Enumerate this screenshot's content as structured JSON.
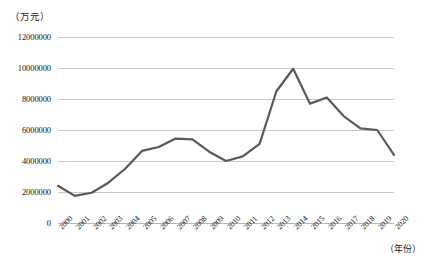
{
  "chart_data": {
    "type": "line",
    "title": "",
    "subtitle": "",
    "xlabel": "（年份）",
    "ylabel": "（万元）",
    "categories": [
      "2000",
      "2001",
      "2002",
      "2003",
      "2004",
      "2005",
      "2006",
      "2007",
      "2008",
      "2009",
      "2010",
      "2011",
      "2012",
      "2013",
      "2014",
      "2015",
      "2016",
      "2017",
      "2018",
      "2019",
      "2020"
    ],
    "values": [
      2400000,
      1750000,
      1950000,
      2600000,
      3500000,
      4650000,
      4900000,
      5450000,
      5400000,
      4600000,
      4000000,
      4300000,
      5100000,
      8500000,
      9950000,
      7700000,
      8100000,
      6900000,
      6100000,
      6000000,
      4400000
    ],
    "series": [
      {
        "name": "",
        "values": [
          2400000,
          1750000,
          1950000,
          2600000,
          3500000,
          4650000,
          4900000,
          5450000,
          5400000,
          4600000,
          4000000,
          4300000,
          5100000,
          8500000,
          9950000,
          7700000,
          8100000,
          6900000,
          6100000,
          6000000,
          4400000
        ]
      }
    ],
    "ylim": [
      0,
      12000000
    ],
    "yticks": [
      0,
      2000000,
      4000000,
      6000000,
      8000000,
      10000000,
      12000000
    ],
    "ytick_labels": [
      "0",
      "2000000",
      "4000000",
      "6000000",
      "8000000",
      "10000000",
      "12000000"
    ],
    "grid": true,
    "grid_axis": "y",
    "legend": false,
    "legend_position": "none",
    "line_color": "#595959",
    "line_width": 2.2,
    "markers": false,
    "background_color": "#ffffff",
    "gridline_color": "#c9c9c9",
    "text_color": "#151515",
    "xtick_rotation": -45
  }
}
